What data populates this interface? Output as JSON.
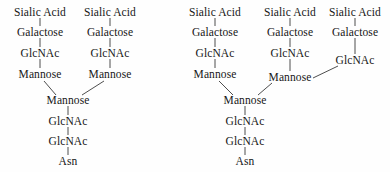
{
  "figure": {
    "background_color": "#fefefe",
    "text_color": "#161616",
    "edge_color": "#3a3a3a"
  },
  "structures": [
    {
      "name": "biantennary-n-glycan",
      "antennae_count": 2,
      "nodes": [
        {
          "id": "L-A1",
          "label": "Sialic Acid",
          "x": 40,
          "y": 12
        },
        {
          "id": "L-A2",
          "label": "Galactose",
          "x": 40,
          "y": 32
        },
        {
          "id": "L-A3",
          "label": "GlcNAc",
          "x": 40,
          "y": 53
        },
        {
          "id": "L-A4",
          "label": "Mannose",
          "x": 40,
          "y": 74
        },
        {
          "id": "L-B1",
          "label": "Sialic Acid",
          "x": 110,
          "y": 12
        },
        {
          "id": "L-B2",
          "label": "Galactose",
          "x": 110,
          "y": 32
        },
        {
          "id": "L-B3",
          "label": "GlcNAc",
          "x": 110,
          "y": 53
        },
        {
          "id": "L-B4",
          "label": "Mannose",
          "x": 110,
          "y": 74
        },
        {
          "id": "L-C1",
          "label": "Mannose",
          "x": 68,
          "y": 100
        },
        {
          "id": "L-C2",
          "label": "GlcNAc",
          "x": 68,
          "y": 121
        },
        {
          "id": "L-C3",
          "label": "GlcNAc",
          "x": 68,
          "y": 141
        },
        {
          "id": "L-C4",
          "label": "Asn",
          "x": 68,
          "y": 161
        }
      ],
      "edges": [
        {
          "from": "L-A1",
          "to": "L-A2",
          "x1": 40,
          "y1": 18,
          "x2": 40,
          "y2": 26
        },
        {
          "from": "L-A2",
          "to": "L-A3",
          "x1": 40,
          "y1": 38,
          "x2": 40,
          "y2": 47
        },
        {
          "from": "L-A3",
          "to": "L-A4",
          "x1": 40,
          "y1": 59,
          "x2": 40,
          "y2": 68
        },
        {
          "from": "L-B1",
          "to": "L-B2",
          "x1": 110,
          "y1": 18,
          "x2": 110,
          "y2": 26
        },
        {
          "from": "L-B2",
          "to": "L-B3",
          "x1": 110,
          "y1": 38,
          "x2": 110,
          "y2": 47
        },
        {
          "from": "L-B3",
          "to": "L-B4",
          "x1": 110,
          "y1": 59,
          "x2": 110,
          "y2": 68
        },
        {
          "from": "L-A4",
          "to": "L-C1",
          "x1": 44,
          "y1": 81,
          "x2": 56,
          "y2": 95
        },
        {
          "from": "L-B4",
          "to": "L-C1",
          "x1": 104,
          "y1": 81,
          "x2": 82,
          "y2": 95
        },
        {
          "from": "L-C1",
          "to": "L-C2",
          "x1": 68,
          "y1": 106,
          "x2": 68,
          "y2": 115
        },
        {
          "from": "L-C2",
          "to": "L-C3",
          "x1": 68,
          "y1": 127,
          "x2": 68,
          "y2": 135
        },
        {
          "from": "L-C3",
          "to": "L-C4",
          "x1": 68,
          "y1": 147,
          "x2": 68,
          "y2": 155
        }
      ]
    },
    {
      "name": "triantennary-n-glycan",
      "antennae_count": 3,
      "nodes": [
        {
          "id": "R-A1",
          "label": "Sialic Acid",
          "x": 215,
          "y": 12
        },
        {
          "id": "R-A2",
          "label": "Galactose",
          "x": 215,
          "y": 32
        },
        {
          "id": "R-A3",
          "label": "GlcNAc",
          "x": 215,
          "y": 53
        },
        {
          "id": "R-A4",
          "label": "Mannose",
          "x": 215,
          "y": 74
        },
        {
          "id": "R-B1",
          "label": "Sialic Acid",
          "x": 290,
          "y": 12
        },
        {
          "id": "R-B2",
          "label": "Galactose",
          "x": 290,
          "y": 32
        },
        {
          "id": "R-B3",
          "label": "GlcNAc",
          "x": 290,
          "y": 53
        },
        {
          "id": "R-B4",
          "label": "Mannose",
          "x": 290,
          "y": 77
        },
        {
          "id": "R-C1",
          "label": "Sialic Acid",
          "x": 355,
          "y": 12
        },
        {
          "id": "R-C2",
          "label": "Galactose",
          "x": 355,
          "y": 32
        },
        {
          "id": "R-C3",
          "label": "GlcNAc",
          "x": 355,
          "y": 60
        },
        {
          "id": "R-D1",
          "label": "Mannose",
          "x": 245,
          "y": 100
        },
        {
          "id": "R-D2",
          "label": "GlcNAc",
          "x": 245,
          "y": 121
        },
        {
          "id": "R-D3",
          "label": "GlcNAc",
          "x": 245,
          "y": 141
        },
        {
          "id": "R-D4",
          "label": "Asn",
          "x": 245,
          "y": 161
        }
      ],
      "edges": [
        {
          "from": "R-A1",
          "to": "R-A2",
          "x1": 215,
          "y1": 18,
          "x2": 215,
          "y2": 26
        },
        {
          "from": "R-A2",
          "to": "R-A3",
          "x1": 215,
          "y1": 38,
          "x2": 215,
          "y2": 47
        },
        {
          "from": "R-A3",
          "to": "R-A4",
          "x1": 215,
          "y1": 59,
          "x2": 215,
          "y2": 68
        },
        {
          "from": "R-B1",
          "to": "R-B2",
          "x1": 290,
          "y1": 18,
          "x2": 290,
          "y2": 26
        },
        {
          "from": "R-B2",
          "to": "R-B3",
          "x1": 290,
          "y1": 38,
          "x2": 290,
          "y2": 47
        },
        {
          "from": "R-B3",
          "to": "R-B4",
          "x1": 290,
          "y1": 59,
          "x2": 290,
          "y2": 71
        },
        {
          "from": "R-C1",
          "to": "R-C2",
          "x1": 355,
          "y1": 18,
          "x2": 355,
          "y2": 26
        },
        {
          "from": "R-C2",
          "to": "R-C3",
          "x1": 355,
          "y1": 38,
          "x2": 355,
          "y2": 54
        },
        {
          "from": "R-C3",
          "to": "R-B4",
          "x1": 338,
          "y1": 66,
          "x2": 313,
          "y2": 78
        },
        {
          "from": "R-A4",
          "to": "R-D1",
          "x1": 219,
          "y1": 81,
          "x2": 233,
          "y2": 95
        },
        {
          "from": "R-B4",
          "to": "R-D1",
          "x1": 272,
          "y1": 83,
          "x2": 258,
          "y2": 95
        },
        {
          "from": "R-D1",
          "to": "R-D2",
          "x1": 245,
          "y1": 106,
          "x2": 245,
          "y2": 115
        },
        {
          "from": "R-D2",
          "to": "R-D3",
          "x1": 245,
          "y1": 127,
          "x2": 245,
          "y2": 135
        },
        {
          "from": "R-D3",
          "to": "R-D4",
          "x1": 245,
          "y1": 147,
          "x2": 245,
          "y2": 155
        }
      ]
    }
  ]
}
